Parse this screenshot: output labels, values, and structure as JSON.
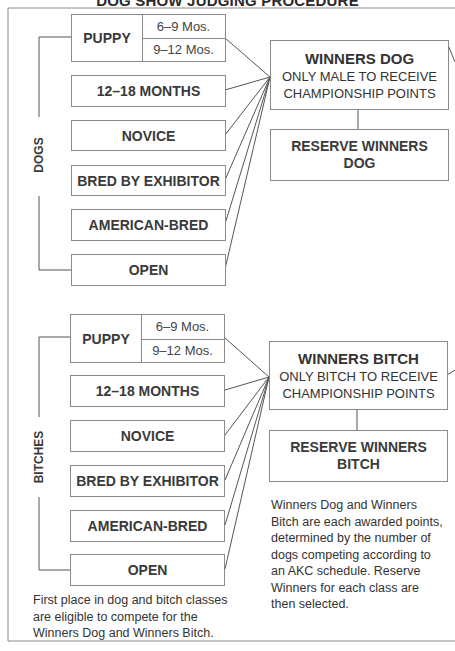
{
  "title": "DOG SHOW JUDGING PROCEDURE",
  "dogs": {
    "group_label": "DOGS",
    "puppy": {
      "label": "PUPPY",
      "sub": [
        "6–9 Mos.",
        "9–12 Mos."
      ]
    },
    "classes": [
      "12–18 MONTHS",
      "NOVICE",
      "BRED BY EXHIBITOR",
      "AMERICAN-BRED",
      "OPEN"
    ],
    "winners": {
      "title": "WINNERS DOG",
      "line1": "ONLY MALE TO RECEIVE",
      "line2": "CHAMPIONSHIP POINTS"
    },
    "reserve": {
      "line1": "RESERVE WINNERS",
      "line2": "DOG"
    }
  },
  "bitches": {
    "group_label": "BITCHES",
    "puppy": {
      "label": "PUPPY",
      "sub": [
        "6–9 Mos.",
        "9–12 Mos."
      ]
    },
    "classes": [
      "12–18 MONTHS",
      "NOVICE",
      "BRED BY EXHIBITOR",
      "AMERICAN-BRED",
      "OPEN"
    ],
    "winners": {
      "title": "WINNERS BITCH",
      "line1": "ONLY BITCH TO RECEIVE",
      "line2": "CHAMPIONSHIP POINTS"
    },
    "reserve": {
      "line1": "RESERVE WINNERS",
      "line2": "BITCH"
    }
  },
  "notes": {
    "left": [
      "First place in dog and bitch classes",
      "are eligible to compete for the",
      "Winners Dog and Winners Bitch."
    ],
    "right": [
      "Winners Dog and Winners",
      "Bitch are each awarded points,",
      "determined by the number of",
      "dogs competing according to",
      "an AKC schedule. Reserve",
      "Winners for each class are",
      "then selected."
    ]
  },
  "colors": {
    "line": "#555555",
    "border": "#8a8a8a",
    "text": "#333333"
  }
}
